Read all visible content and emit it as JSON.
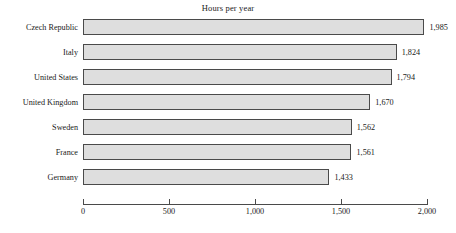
{
  "chart_data": {
    "type": "bar",
    "orientation": "horizontal",
    "title": "Hours per year",
    "xlabel": "",
    "ylabel": "",
    "xlim": [
      0,
      2000
    ],
    "grid": false,
    "legend": null,
    "xticks": [
      "0",
      "500",
      "1,000",
      "1,500",
      "2,000"
    ],
    "xtick_values": [
      0,
      500,
      1000,
      1500,
      2000
    ],
    "categories": [
      "Czech Republic",
      "Italy",
      "United States",
      "United Kingdom",
      "Sweden",
      "France",
      "Germany"
    ],
    "values": [
      1985,
      1824,
      1794,
      1670,
      1562,
      1561,
      1433
    ],
    "value_labels": [
      "1,985",
      "1,824",
      "1,794",
      "1,670",
      "1,562",
      "1,561",
      "1,433"
    ],
    "bar_fill_color": "#dedede",
    "bar_border_color": "#4a4a4a",
    "axis_color": "#4a4a4a",
    "text_color": "#1a1a1a",
    "background_color": "#ffffff"
  }
}
